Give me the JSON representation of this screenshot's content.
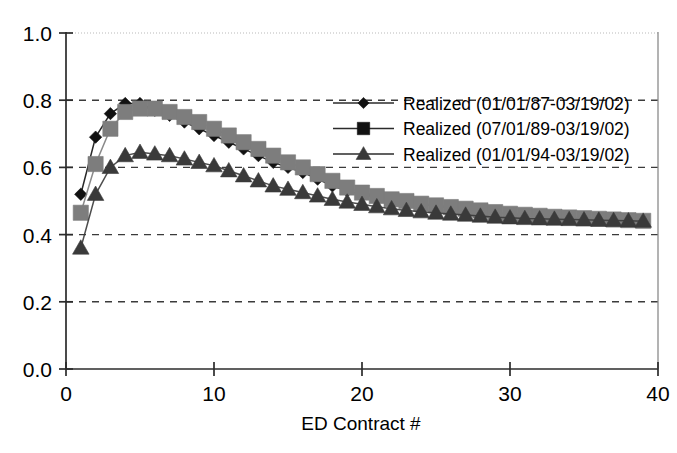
{
  "chart_data": {
    "type": "line",
    "title": "",
    "subtitle": "",
    "xlabel": "ED Contract #",
    "ylabel": "",
    "xlim": [
      0,
      40
    ],
    "ylim": [
      0,
      1.0
    ],
    "xticks": [
      0,
      10,
      20,
      30,
      40
    ],
    "xtick_labels": [
      "0",
      "10",
      "20",
      "30",
      "40"
    ],
    "yticks": [
      0.0,
      0.2,
      0.4,
      0.6,
      0.8,
      1.0
    ],
    "ytick_labels": [
      "0.0",
      "0.2",
      "0.4",
      "0.6",
      "0.8",
      "1.0"
    ],
    "grid": "horizontal-dashed",
    "legend_position": "upper-right-inside",
    "x": [
      1,
      2,
      3,
      4,
      5,
      6,
      7,
      8,
      9,
      10,
      11,
      12,
      13,
      14,
      15,
      16,
      17,
      18,
      19,
      20,
      21,
      22,
      23,
      24,
      25,
      26,
      27,
      28,
      29,
      30,
      31,
      32,
      33,
      34,
      35,
      36,
      37,
      38,
      39
    ],
    "series": [
      {
        "name": "Realized (01/01/87-03/19/02)",
        "marker": "diamond",
        "color": "#111111",
        "values": [
          0.52,
          0.69,
          0.76,
          0.79,
          0.79,
          0.77,
          0.755,
          0.735,
          0.715,
          0.695,
          0.675,
          0.655,
          0.635,
          0.615,
          0.6,
          0.585,
          0.565,
          0.545,
          0.53,
          0.52,
          0.51,
          0.5,
          0.495,
          0.49,
          0.485,
          0.48,
          0.475,
          0.47,
          0.465,
          0.46,
          0.458,
          0.455,
          0.452,
          0.45,
          0.448,
          0.446,
          0.444,
          0.442,
          0.44
        ]
      },
      {
        "name": "Realized (07/01/89-03/19/02)",
        "marker": "square",
        "color": "#7d7d7d",
        "values": [
          0.465,
          0.61,
          0.715,
          0.765,
          0.775,
          0.775,
          0.765,
          0.75,
          0.735,
          0.715,
          0.695,
          0.675,
          0.655,
          0.635,
          0.615,
          0.6,
          0.58,
          0.56,
          0.54,
          0.525,
          0.515,
          0.505,
          0.5,
          0.492,
          0.487,
          0.482,
          0.477,
          0.472,
          0.467,
          0.462,
          0.459,
          0.456,
          0.453,
          0.451,
          0.449,
          0.447,
          0.445,
          0.443,
          0.441
        ]
      },
      {
        "name": "Realized (01/01/94-03/19/02)",
        "marker": "triangle",
        "color": "#3a3a3a",
        "values": [
          0.36,
          0.52,
          0.6,
          0.635,
          0.645,
          0.64,
          0.635,
          0.625,
          0.615,
          0.605,
          0.59,
          0.575,
          0.56,
          0.545,
          0.535,
          0.525,
          0.515,
          0.505,
          0.497,
          0.49,
          0.483,
          0.477,
          0.472,
          0.468,
          0.464,
          0.461,
          0.458,
          0.455,
          0.452,
          0.45,
          0.448,
          0.447,
          0.446,
          0.445,
          0.444,
          0.443,
          0.442,
          0.441,
          0.44
        ]
      }
    ]
  },
  "axis": {
    "x_title": "ED Contract #"
  },
  "legend": {
    "items": [
      {
        "label": "Realized (01/01/87-03/19/02)",
        "marker": "diamond",
        "color": "#111111"
      },
      {
        "label": "Realized (07/01/89-03/19/02)",
        "marker": "square",
        "color": "#111111"
      },
      {
        "label": "Realized (01/01/94-03/19/02)",
        "marker": "triangle",
        "color": "#3a3a3a"
      }
    ]
  }
}
